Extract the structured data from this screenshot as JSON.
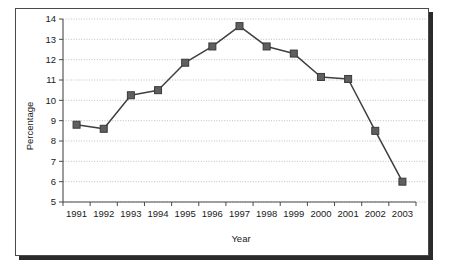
{
  "chart_data": {
    "type": "line",
    "title": "",
    "xlabel": "Year",
    "ylabel": "Percentage",
    "categories": [
      "1991",
      "1992",
      "1993",
      "1994",
      "1995",
      "1996",
      "1997",
      "1998",
      "1999",
      "2000",
      "2001",
      "2002",
      "2003"
    ],
    "values": [
      8.8,
      8.6,
      10.25,
      10.5,
      11.85,
      12.65,
      13.65,
      12.65,
      12.3,
      11.15,
      11.05,
      8.5,
      6.0
    ],
    "series": [
      {
        "name": "Percentage",
        "values": [
          8.8,
          8.6,
          10.25,
          10.5,
          11.85,
          12.65,
          13.65,
          12.65,
          12.3,
          11.15,
          11.05,
          8.5,
          6.0
        ]
      }
    ],
    "ylim": [
      5,
      14
    ],
    "xlim": [
      "1991",
      "2003"
    ],
    "ytick_labels": [
      "5",
      "6",
      "7",
      "8",
      "9",
      "10",
      "11",
      "12",
      "13",
      "14"
    ],
    "ytick_values": [
      5,
      6,
      7,
      8,
      9,
      10,
      11,
      12,
      13,
      14
    ],
    "xtick_labels": [
      "1991",
      "1992",
      "1993",
      "1994",
      "1995",
      "1996",
      "1997",
      "1998",
      "1999",
      "2000",
      "2001",
      "2002",
      "2003"
    ],
    "grid": true,
    "grid_axis": "y",
    "legend": false,
    "legend_position": "none",
    "marker": "square",
    "marker_color": "#5f5f5f",
    "line_color": "#3f3f3f",
    "grid_color": "#b9b9b9",
    "axis_color": "#4a4a4a",
    "background_color": "#ffffff",
    "frame_border_color": "#4a4a4a",
    "frame_shadow_color": "#2b2b2b"
  }
}
